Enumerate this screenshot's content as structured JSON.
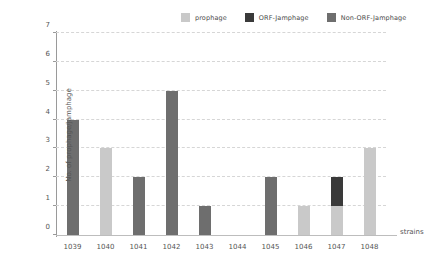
{
  "chart_data": {
    "type": "bar",
    "stacked": true,
    "title": "",
    "xlabel": "strains",
    "ylabel": "No. of prophage/Jamphage",
    "categories": [
      "1039",
      "1040",
      "1041",
      "1042",
      "1043",
      "1044",
      "1045",
      "1046",
      "1047",
      "1048"
    ],
    "series": [
      {
        "name": "prophage",
        "color": "#c9c9c9",
        "values": [
          0,
          3,
          0,
          0,
          0,
          0,
          0,
          1,
          1,
          3
        ]
      },
      {
        "name": "ORF-Jamphage",
        "color": "#3a3a3a",
        "values": [
          0,
          0,
          0,
          0,
          0,
          0,
          0,
          0,
          1,
          0
        ]
      },
      {
        "name": "Non-ORF-Jamphage",
        "color": "#6e6e6e",
        "values": [
          4,
          0,
          2,
          5,
          1,
          0,
          2,
          0,
          0,
          0
        ]
      }
    ],
    "totals": [
      4,
      3,
      2,
      5,
      1,
      0,
      2,
      1,
      2,
      3
    ],
    "ylim": [
      0,
      7
    ],
    "yticks": [
      "0",
      "1",
      "2",
      "3",
      "4",
      "5",
      "6",
      "7"
    ],
    "grid": true,
    "legend_position": "top-right"
  },
  "legend": {
    "items": [
      {
        "label": "prophage",
        "color": "#c9c9c9"
      },
      {
        "label": "ORF-Jamphage",
        "color": "#3a3a3a"
      },
      {
        "label": "Non-ORF-Jamphage",
        "color": "#6e6e6e"
      }
    ]
  },
  "axes": {
    "y_title": "No. of prophage/Jamphage",
    "x_title": "strains"
  }
}
